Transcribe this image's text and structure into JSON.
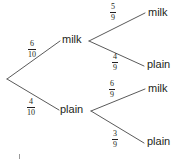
{
  "diagram": {
    "type": "probability-tree",
    "title": "",
    "stroke_color": "#5a5a5a",
    "text_color": "#231f20",
    "background": "#ffffff",
    "root": {
      "label": "",
      "x": 6,
      "y": 78
    },
    "level1": [
      {
        "id": "milk-1",
        "label": "milk",
        "probability": {
          "numerator": "6",
          "denominator": "10"
        },
        "x": 62,
        "y": 39
      },
      {
        "id": "plain-1",
        "label": "plain",
        "probability": {
          "numerator": "4",
          "denominator": "10"
        },
        "x": 60,
        "y": 109
      }
    ],
    "level2": [
      {
        "id": "milk-milk",
        "parent": "milk-1",
        "label": "milk",
        "probability": {
          "numerator": "5",
          "denominator": "9"
        },
        "x": 148,
        "y": 12
      },
      {
        "id": "milk-plain",
        "parent": "milk-1",
        "label": "plain",
        "probability": {
          "numerator": "4",
          "denominator": "9"
        },
        "x": 147,
        "y": 64
      },
      {
        "id": "plain-milk",
        "parent": "plain-1",
        "label": "milk",
        "probability": {
          "numerator": "6",
          "denominator": "9"
        },
        "x": 148,
        "y": 88
      },
      {
        "id": "plain-plain",
        "parent": "plain-1",
        "label": "plain",
        "probability": {
          "numerator": "3",
          "denominator": "9"
        },
        "x": 147,
        "y": 141
      }
    ]
  }
}
